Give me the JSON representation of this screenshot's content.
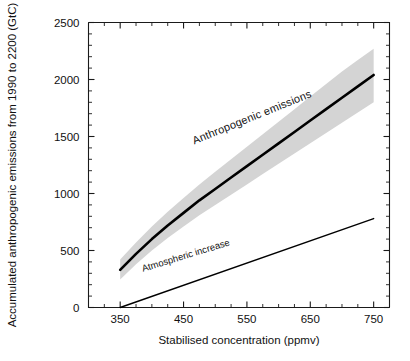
{
  "chart_data": {
    "type": "line",
    "title": "",
    "xlabel": "Stabilised concentration (ppmv)",
    "ylabel": "Accumulated anthropogenic emissions from 1990 to 2200 (GtC)",
    "xlim": [
      300,
      775
    ],
    "ylim": [
      0,
      2500
    ],
    "xticks": [
      350,
      450,
      550,
      650,
      750
    ],
    "xtick_labels": [
      "350",
      "450",
      "550",
      "650",
      "750"
    ],
    "xminor_step": 25,
    "yticks": [
      0,
      500,
      1000,
      1500,
      2000,
      2500
    ],
    "ytick_labels": [
      "0",
      "500",
      "1000",
      "1500",
      "2000",
      "2500"
    ],
    "yminor_step": 100,
    "grid": false,
    "legend": "none",
    "band_color": "#d4d4d4",
    "line_color": "#000000",
    "series": [
      {
        "name": "Anthropogenic emissions",
        "label": "Anthropogenic  emissions",
        "label_x": 560,
        "label_y": 1640,
        "label_rotation": -22,
        "x": [
          350,
          375,
          400,
          425,
          450,
          475,
          500,
          525,
          550,
          575,
          600,
          625,
          650,
          675,
          700,
          725,
          750
        ],
        "values": [
          330,
          470,
          600,
          720,
          830,
          940,
          1040,
          1140,
          1240,
          1340,
          1440,
          1540,
          1640,
          1740,
          1840,
          1940,
          2040
        ],
        "band_upper": [
          420,
          570,
          710,
          840,
          960,
          1080,
          1190,
          1300,
          1410,
          1520,
          1630,
          1740,
          1850,
          1960,
          2070,
          2170,
          2270
        ],
        "band_lower": [
          245,
          380,
          500,
          610,
          710,
          810,
          900,
          990,
          1080,
          1170,
          1260,
          1350,
          1440,
          1530,
          1620,
          1710,
          1800
        ]
      },
      {
        "name": "Atmospheric increase",
        "label": "Atmospheric increase",
        "label_x": 455,
        "label_y": 430,
        "label_rotation": -17,
        "x": [
          350,
          750
        ],
        "values": [
          0,
          780
        ]
      }
    ]
  }
}
